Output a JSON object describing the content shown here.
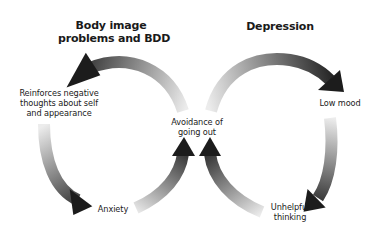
{
  "diagram": {
    "titles": {
      "left": [
        "Body image",
        "problems and BDD"
      ],
      "right": "Depression"
    },
    "nodes": {
      "reinforces": [
        "Reinforces negative",
        "thoughts about self",
        "and appearance"
      ],
      "avoidance": [
        "Avoidance of",
        "going out"
      ],
      "low_mood": "Low mood",
      "anxiety": "Anxiety",
      "unhelpful": [
        "Unhelpful",
        "thinking"
      ]
    },
    "cycles": [
      {
        "name": "Body image problems and BDD",
        "sequence": [
          "Avoidance of going out",
          "Reinforces negative thoughts about self and appearance",
          "Anxiety",
          "Avoidance of going out"
        ]
      },
      {
        "name": "Depression",
        "sequence": [
          "Avoidance of going out",
          "Low mood",
          "Unhelpful thinking",
          "Avoidance of going out"
        ]
      }
    ],
    "colors": {
      "arrow_dark": "#1c1c1c",
      "arrow_light": "#e8e8e8",
      "text": "#1a1a1a",
      "background": "#ffffff"
    }
  }
}
